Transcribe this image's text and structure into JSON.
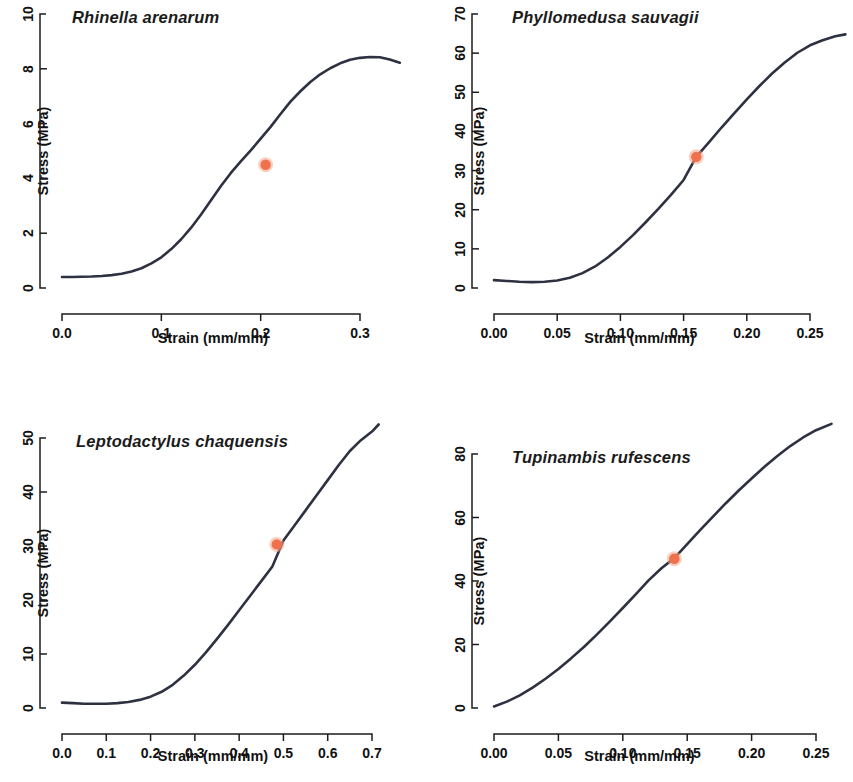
{
  "figure": {
    "background": "#ffffff",
    "curve_color": "#2e3142",
    "marker_color": "#f0714e",
    "marker_halo_color": "#f7a88a",
    "axis_color": "#1c1c1c"
  },
  "common": {
    "xlabel": "Strain (mm/mm)",
    "ylabel": "Stress (MPa)"
  },
  "chart_data": [
    {
      "type": "line",
      "panel": 1,
      "title": "Rhinella arenarum",
      "xlabel": "Strain (mm/mm)",
      "ylabel": "Stress (MPa)",
      "xlim": [
        0.0,
        0.345
      ],
      "ylim": [
        0,
        10
      ],
      "xticks": [
        0.0,
        0.1,
        0.2,
        0.3
      ],
      "xticklabels": [
        "0.0",
        "0.1",
        "0.2",
        "0.3"
      ],
      "yticks": [
        0,
        2,
        4,
        6,
        8,
        10
      ],
      "yticklabels": [
        "0",
        "2",
        "4",
        "6",
        "8",
        "10"
      ],
      "grid": false,
      "legend": "none",
      "series": [
        {
          "name": "Rhinella arenarum stress-strain",
          "x": [
            0.0,
            0.01,
            0.02,
            0.03,
            0.04,
            0.05,
            0.06,
            0.07,
            0.08,
            0.09,
            0.1,
            0.11,
            0.12,
            0.13,
            0.14,
            0.15,
            0.16,
            0.17,
            0.18,
            0.19,
            0.2,
            0.21,
            0.22,
            0.23,
            0.24,
            0.25,
            0.26,
            0.27,
            0.28,
            0.29,
            0.3,
            0.31,
            0.32,
            0.33,
            0.34
          ],
          "y": [
            0.4,
            0.4,
            0.41,
            0.42,
            0.44,
            0.47,
            0.52,
            0.6,
            0.72,
            0.9,
            1.12,
            1.42,
            1.78,
            2.2,
            2.68,
            3.2,
            3.72,
            4.2,
            4.62,
            5.02,
            5.45,
            5.88,
            6.35,
            6.8,
            7.18,
            7.52,
            7.8,
            8.02,
            8.2,
            8.33,
            8.4,
            8.43,
            8.42,
            8.34,
            8.22
          ]
        }
      ],
      "annotation_point": {
        "x": 0.205,
        "y": 4.5,
        "label": "yield point"
      }
    },
    {
      "type": "line",
      "panel": 2,
      "title": "Phyllomedusa sauvagii",
      "xlabel": "Strain (mm/mm)",
      "ylabel": "Stress (MPa)",
      "xlim": [
        0.0,
        0.278
      ],
      "ylim": [
        0,
        70
      ],
      "xticks": [
        0.0,
        0.05,
        0.1,
        0.15,
        0.2,
        0.25
      ],
      "xticklabels": [
        "0.00",
        "0.05",
        "0.10",
        "0.15",
        "0.20",
        "0.25"
      ],
      "yticks": [
        0,
        10,
        20,
        30,
        40,
        50,
        60,
        70
      ],
      "yticklabels": [
        "0",
        "10",
        "20",
        "30",
        "40",
        "50",
        "60",
        "70"
      ],
      "grid": false,
      "legend": "none",
      "series": [
        {
          "name": "Phyllomedusa sauvagii stress-strain",
          "x": [
            0.0,
            0.01,
            0.02,
            0.03,
            0.04,
            0.05,
            0.06,
            0.07,
            0.08,
            0.09,
            0.1,
            0.11,
            0.12,
            0.13,
            0.14,
            0.15,
            0.16,
            0.17,
            0.18,
            0.19,
            0.2,
            0.21,
            0.22,
            0.23,
            0.24,
            0.25,
            0.26,
            0.27,
            0.278
          ],
          "y": [
            2.0,
            1.8,
            1.6,
            1.5,
            1.6,
            1.9,
            2.6,
            3.8,
            5.5,
            7.8,
            10.5,
            13.5,
            16.8,
            20.2,
            23.8,
            27.6,
            33.5,
            37.2,
            41.0,
            44.6,
            48.2,
            51.6,
            54.8,
            57.6,
            60.1,
            62.0,
            63.3,
            64.3,
            64.8
          ]
        }
      ],
      "annotation_point": {
        "x": 0.16,
        "y": 33.5,
        "label": "yield point"
      }
    },
    {
      "type": "line",
      "panel": 3,
      "title": "Leptodactylus chaquensis",
      "xlabel": "Strain (mm/mm)",
      "ylabel": "Stress (MPa)",
      "xlim": [
        0.0,
        0.715
      ],
      "ylim": [
        0,
        53
      ],
      "xticks": [
        0.0,
        0.1,
        0.2,
        0.3,
        0.4,
        0.5,
        0.6,
        0.7
      ],
      "xticklabels": [
        "0.0",
        "0.1",
        "0.2",
        "0.3",
        "0.4",
        "0.5",
        "0.6",
        "0.7"
      ],
      "yticks": [
        0,
        10,
        20,
        30,
        40,
        50
      ],
      "yticklabels": [
        "0",
        "10",
        "20",
        "30",
        "40",
        "50"
      ],
      "grid": false,
      "legend": "none",
      "series": [
        {
          "name": "Leptodactylus chaquensis stress-strain",
          "x": [
            0.0,
            0.025,
            0.05,
            0.075,
            0.1,
            0.125,
            0.15,
            0.175,
            0.2,
            0.225,
            0.25,
            0.275,
            0.3,
            0.325,
            0.35,
            0.375,
            0.4,
            0.425,
            0.45,
            0.475,
            0.5,
            0.525,
            0.55,
            0.575,
            0.6,
            0.625,
            0.65,
            0.675,
            0.7,
            0.715
          ],
          "y": [
            1.0,
            0.9,
            0.8,
            0.8,
            0.8,
            0.9,
            1.1,
            1.5,
            2.1,
            3.0,
            4.3,
            6.0,
            8.0,
            10.3,
            12.8,
            15.4,
            18.1,
            20.8,
            23.5,
            26.2,
            31.0,
            33.8,
            36.6,
            39.4,
            42.2,
            45.0,
            47.6,
            49.6,
            51.2,
            52.5
          ]
        }
      ],
      "annotation_point": {
        "x": 0.485,
        "y": 30.3,
        "label": "yield point"
      }
    },
    {
      "type": "line",
      "panel": 4,
      "title": "Tupinambis rufescens",
      "xlabel": "Strain (mm/mm)",
      "ylabel": "Stress (MPa)",
      "xlim": [
        0.0,
        0.262
      ],
      "ylim": [
        0,
        92
      ],
      "xticks": [
        0.0,
        0.05,
        0.1,
        0.15,
        0.2,
        0.25
      ],
      "xticklabels": [
        "0.00",
        "0.05",
        "0.10",
        "0.15",
        "0.20",
        "0.25"
      ],
      "yticks": [
        0,
        20,
        40,
        60,
        80
      ],
      "yticklabels": [
        "0",
        "20",
        "40",
        "60",
        "80"
      ],
      "grid": false,
      "legend": "none",
      "series": [
        {
          "name": "Tupinambis rufescens stress-strain",
          "x": [
            0.0,
            0.01,
            0.02,
            0.03,
            0.04,
            0.05,
            0.06,
            0.07,
            0.08,
            0.09,
            0.1,
            0.11,
            0.12,
            0.13,
            0.14,
            0.15,
            0.16,
            0.17,
            0.18,
            0.19,
            0.2,
            0.21,
            0.22,
            0.23,
            0.24,
            0.25,
            0.262
          ],
          "y": [
            0.5,
            2.0,
            4.0,
            6.4,
            9.2,
            12.3,
            15.7,
            19.3,
            23.2,
            27.3,
            31.5,
            35.8,
            40.2,
            44.0,
            47.2,
            51.6,
            56.0,
            60.3,
            64.5,
            68.5,
            72.3,
            76.0,
            79.4,
            82.5,
            85.2,
            87.5,
            89.5
          ]
        }
      ],
      "annotation_point": {
        "x": 0.14,
        "y": 47.0,
        "label": "yield point"
      }
    }
  ]
}
